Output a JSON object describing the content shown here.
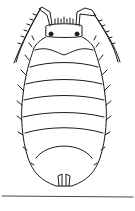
{
  "figure": {
    "background": "#ffffff",
    "stroke": "#1a1a1a",
    "body_segments": 7,
    "has_baseline": true
  }
}
